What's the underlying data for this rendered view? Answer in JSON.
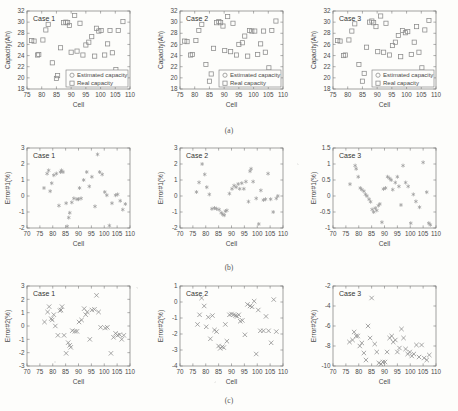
{
  "figure": {
    "row_captions": [
      "(a)",
      "(b)",
      "(c)"
    ],
    "panel_titles": [
      "Case 1",
      "Case 2",
      "Case 3"
    ],
    "xlabel": "Cell",
    "legend": [
      "Estimated capacity",
      "Real capacity"
    ],
    "legend_markers": [
      "circle",
      "square"
    ]
  },
  "chart_data": [
    {
      "type": "scatter",
      "title": "Case 1",
      "xlabel": "Cell",
      "ylabel": "Capacity(Ah)",
      "xlim": [
        75,
        110
      ],
      "ylim": [
        18,
        32
      ],
      "xticks": [
        75,
        80,
        85,
        90,
        95,
        100,
        105,
        110
      ],
      "yticks": [
        18,
        20,
        22,
        24,
        26,
        28,
        30,
        32
      ],
      "grid": false,
      "legend": [
        "Estimated capacity",
        "Real capacity"
      ],
      "legend_position": "lower right",
      "marker": "square",
      "x": [
        76.6,
        77.4,
        78.6,
        79.0,
        80.4,
        81.4,
        82.2,
        83.6,
        85.0,
        85.4,
        86.4,
        87.4,
        88.2,
        88.8,
        89.4,
        90.0,
        91.2,
        92.0,
        93.0,
        94.0,
        95.0,
        96.0,
        97.0,
        98.0,
        98.6,
        99.4,
        100.2,
        101.4,
        102.4,
        103.2,
        104.0,
        105.2,
        106.0,
        107.6
      ],
      "y": [
        26.7,
        26.6,
        24.1,
        24.2,
        26.8,
        28.6,
        29.6,
        22.7,
        19.9,
        20.4,
        25.4,
        29.9,
        30.0,
        29.9,
        29.4,
        24.6,
        31.2,
        24.8,
        29.8,
        24.1,
        25.9,
        26.4,
        27.4,
        23.9,
        28.9,
        28.4,
        28.5,
        24.1,
        26.1,
        28.5,
        24.5,
        21.5,
        28.5,
        30.1
      ]
    },
    {
      "type": "scatter",
      "title": "Case 2",
      "xlabel": "Cell",
      "ylabel": "Capacity(Ah)",
      "xlim": [
        75,
        110
      ],
      "ylim": [
        18,
        32
      ],
      "xticks": [
        75,
        80,
        85,
        90,
        95,
        100,
        105,
        110
      ],
      "yticks": [
        18,
        20,
        22,
        24,
        26,
        28,
        30,
        32
      ],
      "grid": false,
      "legend": [
        "Estimated capacity",
        "Real capacity"
      ],
      "legend_position": "lower right",
      "marker": "square",
      "x": [
        76.6,
        77.4,
        78.6,
        79.2,
        80.4,
        81.4,
        82.4,
        83.8,
        85.0,
        85.6,
        86.4,
        87.4,
        88.2,
        88.8,
        89.6,
        90.2,
        91.2,
        92.2,
        93.0,
        94.2,
        95.0,
        96.2,
        97.0,
        98.0,
        98.6,
        99.4,
        100.4,
        101.4,
        102.4,
        103.4,
        104.0,
        105.2,
        106.2,
        107.6
      ],
      "y": [
        26.6,
        26.5,
        24.1,
        24.2,
        26.7,
        28.5,
        29.6,
        22.4,
        19.4,
        20.7,
        25.3,
        29.9,
        30.1,
        29.9,
        29.3,
        24.9,
        31.0,
        24.7,
        29.8,
        24.1,
        26.0,
        26.3,
        27.5,
        23.9,
        28.5,
        28.4,
        28.4,
        24.2,
        26.1,
        28.4,
        24.6,
        21.8,
        28.5,
        30.2
      ]
    },
    {
      "type": "scatter",
      "title": "Case 3",
      "xlabel": "Cell",
      "ylabel": "Capacity(Ah)",
      "xlim": [
        75,
        110
      ],
      "ylim": [
        18,
        32
      ],
      "xticks": [
        75,
        80,
        85,
        90,
        95,
        100,
        105,
        110
      ],
      "yticks": [
        18,
        20,
        22,
        24,
        26,
        28,
        30,
        32
      ],
      "grid": false,
      "legend": [
        "Estimated capacity",
        "Real capacity"
      ],
      "legend_position": "lower right",
      "marker": "square",
      "x": [
        76.6,
        77.4,
        78.6,
        79.2,
        80.4,
        81.4,
        82.4,
        83.8,
        85.0,
        85.6,
        86.4,
        87.4,
        88.2,
        88.8,
        89.6,
        90.2,
        91.2,
        92.2,
        93.0,
        94.2,
        95.2,
        96.2,
        97.2,
        98.0,
        98.6,
        99.6,
        100.4,
        101.6,
        102.6,
        103.4,
        104.2,
        105.2,
        106.2,
        107.6
      ],
      "y": [
        26.7,
        26.6,
        24.0,
        24.1,
        26.8,
        28.4,
        29.7,
        22.4,
        19.4,
        20.8,
        25.5,
        30.0,
        30.2,
        29.9,
        29.2,
        24.7,
        31.1,
        24.6,
        29.8,
        24.1,
        25.8,
        26.4,
        27.6,
        23.8,
        28.5,
        28.1,
        28.3,
        24.2,
        26.4,
        29.2,
        24.6,
        21.8,
        28.6,
        30.3
      ]
    },
    {
      "type": "scatter",
      "title": "Case 1",
      "xlabel": "Cell",
      "ylabel": "Error#1(%)",
      "xlim": [
        70,
        110
      ],
      "ylim": [
        -2,
        3
      ],
      "xticks": [
        70,
        75,
        80,
        85,
        90,
        95,
        100,
        105,
        110
      ],
      "yticks": [
        -2,
        -1,
        0,
        1,
        2,
        3
      ],
      "grid": false,
      "marker": "star",
      "x": [
        76.6,
        77.8,
        78.4,
        79.0,
        79.6,
        80.4,
        81.4,
        82.4,
        83.0,
        83.4,
        84.0,
        85.2,
        85.6,
        86.2,
        86.6,
        87.4,
        88.2,
        89.4,
        90.0,
        90.4,
        91.0,
        92.0,
        93.2,
        94.2,
        95.2,
        96.4,
        97.4,
        98.2,
        99.2,
        100.2,
        101.0,
        102.0,
        103.0,
        104.4,
        105.2,
        106.2,
        107.2,
        108.2
      ],
      "y": [
        0.5,
        1.4,
        1.6,
        0.3,
        0.8,
        1.3,
        1.4,
        -0.6,
        1.5,
        1.6,
        1.5,
        -0.45,
        -1.9,
        -1.35,
        -1.05,
        -0.4,
        -0.15,
        -0.2,
        -0.2,
        0.5,
        -0.15,
        1.0,
        1.5,
        0.6,
        1.2,
        -0.65,
        2.6,
        1.5,
        1.35,
        0.25,
        0.05,
        -1.85,
        -0.45,
        0.05,
        0.1,
        -0.3,
        -0.85,
        -0.5
      ]
    },
    {
      "type": "scatter",
      "title": "Case 2",
      "xlabel": "Cell",
      "ylabel": "Error#1(%)",
      "xlim": [
        70,
        110
      ],
      "ylim": [
        -2,
        3
      ],
      "xticks": [
        70,
        75,
        80,
        85,
        90,
        95,
        100,
        105,
        110
      ],
      "yticks": [
        -2,
        -1,
        0,
        1,
        2,
        3
      ],
      "grid": false,
      "marker": "star",
      "x": [
        76.4,
        77.4,
        78.6,
        79.6,
        80.4,
        81.4,
        82.4,
        83.4,
        84.2,
        85.2,
        86.0,
        86.6,
        87.2,
        87.6,
        88.2,
        89.2,
        90.2,
        91.0,
        91.8,
        92.6,
        93.2,
        94.0,
        94.8,
        95.6,
        96.6,
        97.2,
        97.6,
        98.4,
        99.6,
        100.6,
        101.4,
        102.4,
        103.2,
        104.2,
        105.2,
        106.2,
        107.4,
        108.0
      ],
      "y": [
        0.25,
        0.85,
        2.0,
        1.35,
        0.55,
        0.1,
        -0.8,
        -0.75,
        -0.8,
        -0.85,
        -1.05,
        -1.15,
        -1.2,
        -0.95,
        -0.9,
        0.15,
        0.45,
        0.65,
        0.55,
        0.75,
        0.45,
        0.8,
        0.45,
        0.9,
        -0.35,
        1.55,
        1.7,
        0.9,
        -0.15,
        -1.75,
        0.35,
        -0.25,
        -0.2,
        1.4,
        -0.2,
        -1.0,
        -0.15,
        0.0
      ]
    },
    {
      "type": "scatter",
      "title": "Case 3",
      "xlabel": "Cell",
      "ylabel": "Error#1(%)",
      "xlim": [
        70,
        110
      ],
      "ylim": [
        -1,
        1.5
      ],
      "xticks": [
        70,
        75,
        80,
        85,
        90,
        95,
        100,
        105,
        110
      ],
      "yticks": [
        -1,
        -0.5,
        0,
        0.5,
        1,
        1.5
      ],
      "grid": false,
      "marker": "star",
      "x": [
        76.6,
        78.6,
        79.0,
        79.8,
        80.6,
        81.2,
        82.0,
        82.6,
        83.2,
        84.0,
        84.6,
        85.2,
        85.8,
        86.4,
        87.0,
        87.6,
        88.2,
        89.0,
        89.6,
        90.4,
        91.2,
        92.0,
        92.6,
        93.2,
        94.2,
        95.0,
        95.6,
        96.4,
        97.2,
        98.2,
        99.2,
        100.2,
        101.2,
        102.2,
        103.6,
        105.0,
        106.4,
        107.2,
        107.8
      ],
      "y": [
        0.37,
        0.95,
        0.85,
        0.6,
        0.25,
        0.2,
        0.15,
        0.05,
        0.0,
        -0.1,
        -0.18,
        -0.42,
        -0.5,
        -0.38,
        -0.45,
        -0.3,
        -0.25,
        -0.82,
        0.22,
        0.25,
        0.6,
        0.55,
        0.5,
        0.2,
        0.42,
        0.6,
        0.3,
        -0.28,
        0.95,
        0.42,
        0.3,
        -0.85,
        0.05,
        -0.17,
        -0.35,
        1.05,
        0.12,
        -0.85,
        -0.9
      ]
    },
    {
      "type": "scatter",
      "title": "Case 1",
      "xlabel": "Cell",
      "ylabel": "Error#2(%)",
      "xlim": [
        70,
        110
      ],
      "ylim": [
        -3,
        3
      ],
      "xticks": [
        70,
        75,
        80,
        85,
        90,
        95,
        100,
        105,
        110
      ],
      "yticks": [
        -3,
        -2,
        -1,
        0,
        1,
        2,
        3
      ],
      "grid": false,
      "marker": "cross",
      "x": [
        76.8,
        78.0,
        78.6,
        79.4,
        79.8,
        80.4,
        81.0,
        82.0,
        82.8,
        83.2,
        83.6,
        84.4,
        85.2,
        86.0,
        86.6,
        87.0,
        87.6,
        88.6,
        89.4,
        90.2,
        91.2,
        92.2,
        92.8,
        93.4,
        94.4,
        95.2,
        96.2,
        97.0,
        97.8,
        98.6,
        100.4,
        101.2,
        102.6,
        103.6,
        104.4,
        105.2,
        106.0,
        106.8,
        107.6
      ],
      "y": [
        0.3,
        1.05,
        1.45,
        0.55,
        0.45,
        0.85,
        0.0,
        -0.7,
        1.15,
        1.2,
        1.45,
        -0.7,
        -2.05,
        -1.25,
        -1.45,
        -1.6,
        -0.35,
        -0.4,
        -0.4,
        0.3,
        0.45,
        1.3,
        0.85,
        1.05,
        -1.0,
        1.2,
        1.25,
        2.3,
        1.05,
        -0.1,
        -0.15,
        -0.1,
        -2.05,
        -0.85,
        -0.55,
        -0.7,
        -0.65,
        -1.0,
        -0.7
      ]
    },
    {
      "type": "scatter",
      "title": "Case 2",
      "xlabel": "Cell",
      "ylabel": "Error#2(%)",
      "xlim": [
        70,
        110
      ],
      "ylim": [
        -4,
        1
      ],
      "xticks": [
        70,
        75,
        80,
        85,
        90,
        95,
        100,
        105,
        110
      ],
      "yticks": [
        -4,
        -3,
        -2,
        -1,
        0,
        1
      ],
      "grid": false,
      "marker": "cross",
      "x": [
        76.8,
        77.6,
        78.4,
        79.4,
        80.2,
        81.0,
        81.8,
        82.6,
        83.4,
        84.2,
        85.0,
        85.6,
        86.4,
        87.0,
        87.6,
        88.2,
        89.2,
        90.0,
        90.8,
        91.6,
        92.2,
        92.8,
        93.4,
        94.2,
        95.2,
        96.2,
        97.2,
        98.0,
        98.8,
        99.6,
        100.4,
        101.2,
        102.4,
        103.4,
        104.4,
        105.4,
        106.4,
        107.4
      ],
      "y": [
        -1.4,
        -0.8,
        0.25,
        -0.25,
        -1.55,
        -0.95,
        -2.3,
        -0.85,
        -1.75,
        -1.85,
        -2.75,
        -2.9,
        -2.8,
        -2.85,
        -1.4,
        -2.45,
        -0.8,
        -0.75,
        -0.8,
        -0.85,
        -0.9,
        -0.8,
        -1.2,
        -1.15,
        -2.05,
        -0.15,
        -0.25,
        -0.3,
        0.05,
        -3.25,
        -0.5,
        -1.8,
        -1.8,
        -0.9,
        -1.8,
        -2.55,
        0.15,
        -1.85
      ]
    },
    {
      "type": "scatter",
      "title": "Case 3",
      "xlabel": "Cell",
      "ylabel": "Error#2(%)",
      "xlim": [
        70,
        110
      ],
      "ylim": [
        -10,
        -2
      ],
      "xticks": [
        70,
        75,
        80,
        85,
        90,
        95,
        100,
        105,
        110
      ],
      "yticks": [
        -10,
        -8,
        -6,
        -4,
        -2
      ],
      "grid": false,
      "marker": "cross",
      "x": [
        76.4,
        77.6,
        78.2,
        79.0,
        79.6,
        80.4,
        81.2,
        82.0,
        82.8,
        83.6,
        84.4,
        85.0,
        86.2,
        87.0,
        87.8,
        88.6,
        89.4,
        90.2,
        91.0,
        92.0,
        92.8,
        93.4,
        94.2,
        95.0,
        95.8,
        96.6,
        97.4,
        98.2,
        99.0,
        99.8,
        100.6,
        101.4,
        102.4,
        103.4,
        104.4,
        105.4,
        106.4,
        107.4
      ],
      "y": [
        -7.6,
        -7.4,
        -6.6,
        -7.0,
        -7.0,
        -8.0,
        -7.7,
        -8.7,
        -9.4,
        -6.0,
        -7.2,
        -3.2,
        -7.8,
        -8.6,
        -9.7,
        -9.8,
        -9.6,
        -9.6,
        -8.6,
        -7.2,
        -7.0,
        -7.6,
        -7.4,
        -8.6,
        -8.2,
        -6.3,
        -7.2,
        -8.3,
        -8.8,
        -8.6,
        -9.0,
        -8.8,
        -7.9,
        -9.1,
        -7.9,
        -9.2,
        -9.4,
        -8.9
      ]
    }
  ]
}
